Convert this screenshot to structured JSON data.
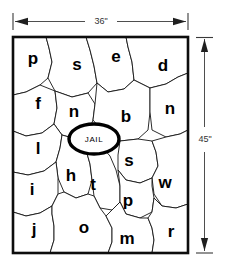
{
  "figure": {
    "jail_label": "JAIL",
    "dimensions": {
      "width_label": "36\"",
      "height_label": "45\""
    },
    "colors": {
      "background": "#ffffff",
      "cell_fill": "#ffffff",
      "cell_stroke": "#141414",
      "frame_stroke": "#0d0d0d",
      "label_color": "#000000",
      "dimension_color": "#333333"
    },
    "cells": [
      {
        "id": "cell-p-top",
        "label": "p",
        "x": 33,
        "y": 60
      },
      {
        "id": "cell-s-top",
        "label": "s",
        "x": 77,
        "y": 66
      },
      {
        "id": "cell-e-top",
        "label": "e",
        "x": 116,
        "y": 58
      },
      {
        "id": "cell-d-top",
        "label": "d",
        "x": 163,
        "y": 67
      },
      {
        "id": "cell-f",
        "label": "f",
        "x": 38,
        "y": 105
      },
      {
        "id": "cell-n-left",
        "label": "n",
        "x": 74,
        "y": 113
      },
      {
        "id": "cell-b",
        "label": "b",
        "x": 126,
        "y": 118
      },
      {
        "id": "cell-n-right",
        "label": "n",
        "x": 170,
        "y": 110
      },
      {
        "id": "cell-l",
        "label": "l",
        "x": 38,
        "y": 150
      },
      {
        "id": "cell-s-mid",
        "label": "s",
        "x": 129,
        "y": 162
      },
      {
        "id": "cell-h",
        "label": "h",
        "x": 71,
        "y": 177
      },
      {
        "id": "cell-t",
        "label": "t",
        "x": 93,
        "y": 186
      },
      {
        "id": "cell-w",
        "label": "w",
        "x": 165,
        "y": 184
      },
      {
        "id": "cell-i",
        "label": "i",
        "x": 32,
        "y": 191
      },
      {
        "id": "cell-p-bottom",
        "label": "p",
        "x": 128,
        "y": 202
      },
      {
        "id": "cell-j",
        "label": "j",
        "x": 34,
        "y": 231
      },
      {
        "id": "cell-o",
        "label": "o",
        "x": 84,
        "y": 229
      },
      {
        "id": "cell-m",
        "label": "m",
        "x": 127,
        "y": 240
      },
      {
        "id": "cell-r",
        "label": "r",
        "x": 171,
        "y": 233
      }
    ]
  }
}
